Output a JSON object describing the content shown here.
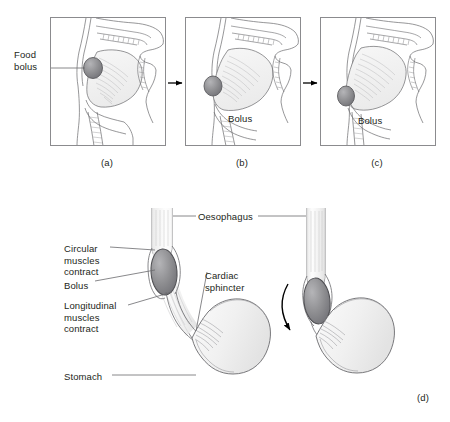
{
  "figure": {
    "background_color": "#ffffff",
    "line_color": "#58585b",
    "text_color": "#231f20",
    "bolus_fill": "#8a8a8d",
    "organ_fill": "#f2f2f2"
  },
  "panels": [
    {
      "id": "a",
      "caption": "(a)",
      "labels": [
        {
          "name": "food-bolus",
          "text": "Food\nbolus"
        }
      ]
    },
    {
      "id": "b",
      "caption": "(b)",
      "labels": [
        {
          "name": "bolus",
          "text": "Bolus"
        }
      ]
    },
    {
      "id": "c",
      "caption": "(c)",
      "labels": [
        {
          "name": "bolus",
          "text": "Bolus"
        }
      ]
    },
    {
      "id": "d",
      "caption": "(d)",
      "labels": [
        {
          "name": "circular-muscles-contract",
          "text": "Circular\nmuscles\ncontract"
        },
        {
          "name": "bolus",
          "text": "Bolus"
        },
        {
          "name": "longitudinal-muscles-contract",
          "text": "Longitudinal\nmuscles\ncontract"
        },
        {
          "name": "stomach",
          "text": "Stomach"
        },
        {
          "name": "oesophagus",
          "text": "Oesophagus"
        },
        {
          "name": "cardiac-sphincter",
          "text": "Cardiac\nsphincter"
        }
      ]
    }
  ],
  "labels": {
    "food_bolus_line1": "Food",
    "food_bolus_line2": "bolus",
    "bolus_b": "Bolus",
    "bolus_c": "Bolus",
    "circular_line1": "Circular",
    "circular_line2": "muscles",
    "circular_line3": "contract",
    "bolus_d": "Bolus",
    "longitudinal_line1": "Longitudinal",
    "longitudinal_line2": "muscles",
    "longitudinal_line3": "contract",
    "stomach": "Stomach",
    "oesophagus": "Oesophagus",
    "cardiac_line1": "Cardiac",
    "cardiac_line2": "sphincter"
  },
  "captions": {
    "a": "(a)",
    "b": "(b)",
    "c": "(c)",
    "d": "(d)"
  }
}
